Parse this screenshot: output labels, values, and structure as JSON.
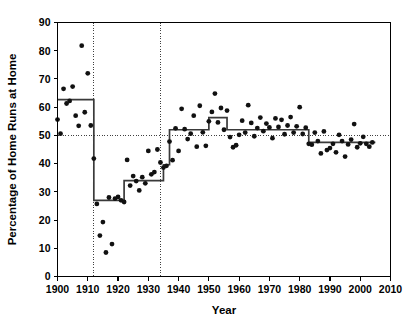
{
  "chart_data": {
    "type": "scatter",
    "title": "",
    "xlabel": "Year",
    "ylabel": "Percentage of Home Runs at Home",
    "xlim": [
      1900,
      2010
    ],
    "ylim": [
      0,
      90
    ],
    "xticks": [
      1900,
      1910,
      1920,
      1930,
      1940,
      1950,
      1960,
      1970,
      1980,
      1990,
      2000,
      2010
    ],
    "yticks": [
      0,
      10,
      20,
      30,
      40,
      50,
      60,
      70,
      80,
      90
    ],
    "grid": false,
    "legend_position": "none",
    "reference_lines": {
      "horizontal": [
        50
      ],
      "vertical": [
        1912,
        1934
      ]
    },
    "series": [
      {
        "name": "Percentage of home runs hit at home",
        "marker": "filled-circle",
        "points": [
          [
            1900,
            55.6
          ],
          [
            1901,
            50.6
          ],
          [
            1902,
            66.5
          ],
          [
            1903,
            61.3
          ],
          [
            1904,
            62.2
          ],
          [
            1905,
            67.3
          ],
          [
            1906,
            57.0
          ],
          [
            1907,
            53.4
          ],
          [
            1908,
            81.8
          ],
          [
            1909,
            58.2
          ],
          [
            1910,
            72.0
          ],
          [
            1911,
            53.5
          ],
          [
            1912,
            41.8
          ],
          [
            1913,
            25.7
          ],
          [
            1914,
            14.5
          ],
          [
            1915,
            19.3
          ],
          [
            1916,
            8.5
          ],
          [
            1917,
            28.0
          ],
          [
            1918,
            11.5
          ],
          [
            1919,
            27.6
          ],
          [
            1920,
            28.2
          ],
          [
            1921,
            27.0
          ],
          [
            1922,
            26.4
          ],
          [
            1923,
            41.3
          ],
          [
            1924,
            32.2
          ],
          [
            1925,
            35.6
          ],
          [
            1926,
            33.8
          ],
          [
            1927,
            30.5
          ],
          [
            1928,
            35.2
          ],
          [
            1929,
            33.0
          ],
          [
            1930,
            44.5
          ],
          [
            1931,
            36.2
          ],
          [
            1932,
            37.0
          ],
          [
            1933,
            45.0
          ],
          [
            1934,
            40.4
          ],
          [
            1935,
            38.6
          ],
          [
            1936,
            39.2
          ],
          [
            1937,
            47.8
          ],
          [
            1938,
            41.2
          ],
          [
            1939,
            52.5
          ],
          [
            1940,
            44.5
          ],
          [
            1941,
            59.4
          ],
          [
            1942,
            52.2
          ],
          [
            1943,
            48.7
          ],
          [
            1944,
            50.6
          ],
          [
            1945,
            57.0
          ],
          [
            1946,
            46.0
          ],
          [
            1947,
            60.5
          ],
          [
            1948,
            51.1
          ],
          [
            1949,
            46.3
          ],
          [
            1950,
            55.0
          ],
          [
            1951,
            58.3
          ],
          [
            1952,
            64.8
          ],
          [
            1953,
            54.6
          ],
          [
            1954,
            59.7
          ],
          [
            1955,
            52.0
          ],
          [
            1956,
            58.8
          ],
          [
            1957,
            49.4
          ],
          [
            1958,
            45.8
          ],
          [
            1959,
            46.5
          ],
          [
            1960,
            50.2
          ],
          [
            1961,
            55.2
          ],
          [
            1962,
            51.0
          ],
          [
            1963,
            60.7
          ],
          [
            1964,
            54.4
          ],
          [
            1965,
            49.7
          ],
          [
            1966,
            52.6
          ],
          [
            1967,
            56.3
          ],
          [
            1968,
            51.5
          ],
          [
            1969,
            54.2
          ],
          [
            1970,
            52.8
          ],
          [
            1971,
            49.0
          ],
          [
            1972,
            56.0
          ],
          [
            1973,
            53.0
          ],
          [
            1974,
            55.5
          ],
          [
            1975,
            50.4
          ],
          [
            1976,
            53.5
          ],
          [
            1977,
            56.5
          ],
          [
            1978,
            51.0
          ],
          [
            1979,
            53.2
          ],
          [
            1980,
            60.0
          ],
          [
            1981,
            50.5
          ],
          [
            1982,
            52.7
          ],
          [
            1983,
            47.0
          ],
          [
            1984,
            46.7
          ],
          [
            1985,
            51.0
          ],
          [
            1986,
            48.0
          ],
          [
            1987,
            43.6
          ],
          [
            1988,
            51.4
          ],
          [
            1989,
            44.8
          ],
          [
            1990,
            45.5
          ],
          [
            1991,
            47.0
          ],
          [
            1992,
            44.0
          ],
          [
            1993,
            50.2
          ],
          [
            1994,
            48.0
          ],
          [
            1995,
            42.5
          ],
          [
            1996,
            46.8
          ],
          [
            1997,
            48.5
          ],
          [
            1998,
            54.0
          ],
          [
            1999,
            45.8
          ],
          [
            2000,
            47.2
          ],
          [
            2001,
            49.5
          ],
          [
            2002,
            47.0
          ],
          [
            2003,
            46.0
          ],
          [
            2004,
            47.5
          ]
        ]
      }
    ],
    "step_fit": {
      "name": "Fitted step function (changepoint segments)",
      "segments": [
        {
          "start": 1900,
          "end": 1912,
          "level": 62.7
        },
        {
          "start": 1912,
          "end": 1922,
          "level": 27.0
        },
        {
          "start": 1922,
          "end": 1935,
          "level": 34.0
        },
        {
          "start": 1935,
          "end": 1937,
          "level": 39.6
        },
        {
          "start": 1937,
          "end": 1950,
          "level": 52.0
        },
        {
          "start": 1950,
          "end": 1956,
          "level": 56.3
        },
        {
          "start": 1956,
          "end": 1983,
          "level": 52.0
        },
        {
          "start": 1983,
          "end": 2005,
          "level": 47.5
        }
      ]
    }
  },
  "axes": {
    "x_title": "Year",
    "y_title": "Percentage of Home Runs at Home",
    "x_tick_labels": [
      "1900",
      "1910",
      "1920",
      "1930",
      "1940",
      "1950",
      "1960",
      "1970",
      "1980",
      "1990",
      "2000",
      "2010"
    ],
    "y_tick_labels": [
      "0",
      "10",
      "20",
      "30",
      "40",
      "50",
      "60",
      "70",
      "80",
      "90"
    ]
  }
}
